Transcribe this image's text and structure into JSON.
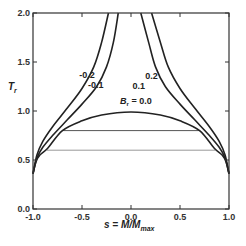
{
  "chart_data": {
    "type": "line",
    "title": "",
    "xlabel": "s = M/M_max",
    "xlabel_main": "s = M/M",
    "xlabel_sub": "max",
    "ylabel": "T_r",
    "ylabel_main": "T",
    "ylabel_sub": "r",
    "xlim": [
      -1.0,
      1.0
    ],
    "ylim": [
      0.0,
      2.0
    ],
    "grid": false,
    "legend": "inline curve labels",
    "xticks": [
      -1.0,
      -0.5,
      0.0,
      0.5,
      1.0
    ],
    "xtick_labels": [
      "-1.0",
      "-0.5",
      "0.0",
      "0.5",
      "1.0"
    ],
    "yticks": [
      0.0,
      0.5,
      1.0,
      1.5,
      2.0
    ],
    "ytick_labels": [
      "0.0",
      "0.5",
      "1.0",
      "1.5",
      "2.0"
    ],
    "series": [
      {
        "name": "B_r = 0.0",
        "label": "B",
        "label_sub": "r",
        "label_suffix": " = 0.0",
        "points": [
          [
            -1.0,
            0.36
          ],
          [
            -0.97,
            0.48
          ],
          [
            -0.93,
            0.55
          ],
          [
            -0.85,
            0.62
          ],
          [
            -0.7,
            0.8
          ],
          [
            -0.5,
            0.9
          ],
          [
            -0.3,
            0.96
          ],
          [
            0.0,
            0.99
          ],
          [
            0.3,
            0.96
          ],
          [
            0.5,
            0.9
          ],
          [
            0.7,
            0.8
          ],
          [
            0.85,
            0.62
          ],
          [
            0.93,
            0.55
          ],
          [
            0.97,
            0.48
          ],
          [
            1.0,
            0.36
          ]
        ]
      },
      {
        "name": "B_r = -0.1",
        "label": "-0.1",
        "points": [
          [
            -1.0,
            0.36
          ],
          [
            -0.96,
            0.52
          ],
          [
            -0.9,
            0.63
          ],
          [
            -0.8,
            0.75
          ],
          [
            -0.65,
            0.91
          ],
          [
            -0.5,
            1.07
          ],
          [
            -0.35,
            1.25
          ],
          [
            -0.25,
            1.45
          ],
          [
            -0.18,
            1.7
          ],
          [
            -0.13,
            2.0
          ]
        ]
      },
      {
        "name": "B_r = -0.2",
        "label": "-0.2",
        "points": [
          [
            -1.0,
            0.36
          ],
          [
            -0.96,
            0.55
          ],
          [
            -0.9,
            0.69
          ],
          [
            -0.8,
            0.84
          ],
          [
            -0.65,
            1.03
          ],
          [
            -0.5,
            1.23
          ],
          [
            -0.38,
            1.45
          ],
          [
            -0.3,
            1.7
          ],
          [
            -0.23,
            2.0
          ]
        ]
      },
      {
        "name": "B_r = 0.1",
        "label": "0.1",
        "points": [
          [
            1.0,
            0.36
          ],
          [
            0.96,
            0.52
          ],
          [
            0.9,
            0.63
          ],
          [
            0.8,
            0.75
          ],
          [
            0.65,
            0.91
          ],
          [
            0.5,
            1.07
          ],
          [
            0.35,
            1.25
          ],
          [
            0.25,
            1.45
          ],
          [
            0.18,
            1.7
          ],
          [
            0.1,
            2.0
          ]
        ]
      },
      {
        "name": "B_r = 0.2",
        "label": "0.2",
        "points": [
          [
            1.0,
            0.36
          ],
          [
            0.96,
            0.55
          ],
          [
            0.9,
            0.69
          ],
          [
            0.8,
            0.84
          ],
          [
            0.65,
            1.03
          ],
          [
            0.5,
            1.23
          ],
          [
            0.38,
            1.45
          ],
          [
            0.3,
            1.7
          ],
          [
            0.21,
            2.0
          ]
        ]
      }
    ],
    "horizontal_lines": [
      {
        "y": 0.8,
        "x_from": -0.7,
        "x_to": 0.7,
        "color": "#555555"
      },
      {
        "y": 0.6,
        "x_from": -0.86,
        "x_to": 0.86,
        "color": "#999999"
      }
    ],
    "annotations": [
      {
        "text": "-0.2",
        "x": -0.45,
        "y": 1.34
      },
      {
        "text": "-0.1",
        "x": -0.36,
        "y": 1.23
      },
      {
        "text": "0.1",
        "x": 0.08,
        "y": 1.22
      },
      {
        "text": "0.2",
        "x": 0.21,
        "y": 1.33
      },
      {
        "text": "B_r = 0.0",
        "x": 0.05,
        "y": 1.07
      }
    ]
  },
  "colors": {
    "curve": "#222222",
    "axis": "#333333",
    "background": "#ffffff"
  }
}
